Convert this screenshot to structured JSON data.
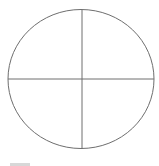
{
  "diagram": {
    "type": "circle-quadrants",
    "circle": {
      "cx": 81,
      "cy": 79,
      "rx": 73,
      "ry": 69.5,
      "stroke": "#6e6e6e",
      "fill": "#ffffff"
    },
    "vertical_line": {
      "x": 82,
      "y1": 10,
      "y2": 149,
      "stroke": "#6e6e6e"
    },
    "horizontal_line": {
      "y": 79,
      "x1": 8,
      "x2": 154,
      "stroke": "#6e6e6e"
    },
    "quadrants": [
      "top-left",
      "top-right",
      "bottom-left",
      "bottom-right"
    ]
  },
  "colors": {
    "background": "#ffffff",
    "stroke": "#6e6e6e",
    "partial_bar": "#d8d8d8"
  }
}
